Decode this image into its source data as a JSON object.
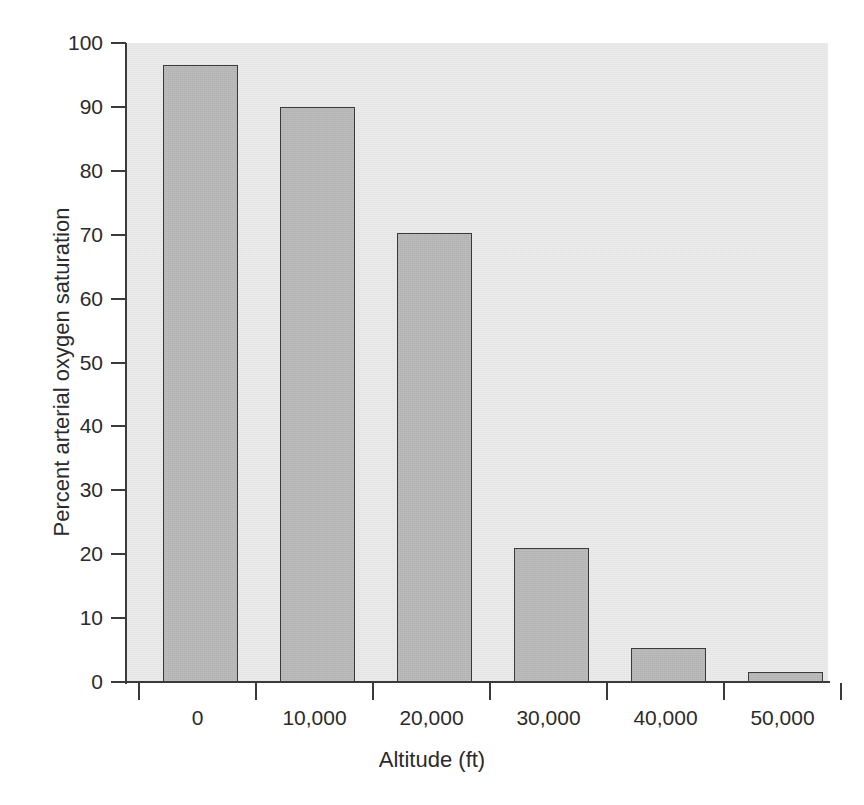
{
  "figure": {
    "background_color": "#ffffff",
    "plot_background_color": "#e7e7e7",
    "bar_fill_color": "#b6b6b6",
    "bar_edge_color": "#3a3a3a",
    "axis_color": "#3a3a3a",
    "top_crop_artifact": "gy"
  },
  "chart_data": {
    "type": "bar",
    "title": "",
    "subtitle": "",
    "xlabel": "Altitude (ft)",
    "ylabel": "Percent arterial oxygen saturation",
    "categories": [
      "0",
      "10,000",
      "20,000",
      "30,000",
      "40,000",
      "50,000"
    ],
    "values": [
      96.5,
      90.0,
      70.3,
      21.0,
      5.4,
      1.6
    ],
    "series": [
      {
        "name": "Percent arterial oxygen saturation",
        "values": [
          96.5,
          90.0,
          70.3,
          21.0,
          5.4,
          1.6
        ]
      }
    ],
    "ylim": [
      0,
      100
    ],
    "ytick_labels": [
      "0",
      "10",
      "20",
      "30",
      "40",
      "50",
      "60",
      "70",
      "80",
      "90",
      "100"
    ],
    "ytick_values": [
      0,
      10,
      20,
      30,
      40,
      50,
      60,
      70,
      80,
      90,
      100
    ],
    "xtick_labels": [
      "0",
      "10,000",
      "20,000",
      "30,000",
      "40,000",
      "50,000"
    ],
    "grid": false,
    "legend": false,
    "legend_position": "none",
    "annotations": []
  }
}
